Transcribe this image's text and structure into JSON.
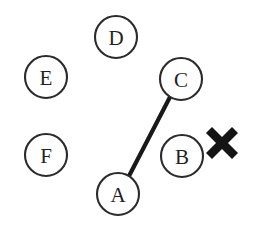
{
  "figure": {
    "background_color": "#ffffff",
    "width": 259,
    "height": 234,
    "stroke_color": "#2b2b2b",
    "edge_color": "#191919",
    "mark_color": "#141414"
  },
  "nodes": [
    {
      "id": "A",
      "label": "A",
      "cx": 118,
      "cy": 194,
      "r": 21
    },
    {
      "id": "B",
      "label": "B",
      "cx": 182,
      "cy": 156,
      "r": 21
    },
    {
      "id": "C",
      "label": "C",
      "cx": 181,
      "cy": 79,
      "r": 21
    },
    {
      "id": "D",
      "label": "D",
      "cx": 116,
      "cy": 37,
      "r": 21
    },
    {
      "id": "E",
      "label": "E",
      "cx": 46,
      "cy": 77,
      "r": 21
    },
    {
      "id": "F",
      "label": "F",
      "cx": 46,
      "cy": 155,
      "r": 21
    }
  ],
  "edges": [
    {
      "id": "edge-a-c",
      "from": "A",
      "to": "C",
      "x1": 129,
      "y1": 176,
      "x2": 170,
      "y2": 97
    }
  ],
  "marks": [
    {
      "id": "x-mark",
      "symbol": "X",
      "cx": 222,
      "cy": 143,
      "size": 32
    }
  ]
}
